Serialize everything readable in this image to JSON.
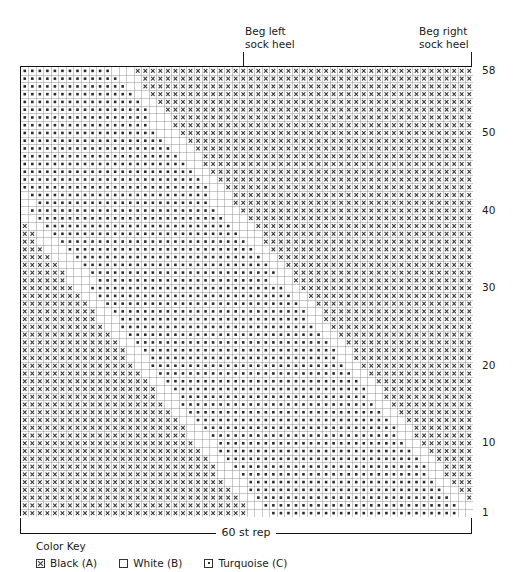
{
  "annotations": {
    "left_heel": "Beg left\nsock heel",
    "right_heel": "Beg right\nsock heel"
  },
  "repeat": {
    "label": "60 st rep"
  },
  "row_numbers": [
    "58",
    "50",
    "40",
    "30",
    "20",
    "10",
    "1"
  ],
  "color_key": {
    "title": "Color Key",
    "items": [
      {
        "symbol": "x",
        "label": "Black (A)",
        "color": "#000000"
      },
      {
        "symbol": "blank",
        "label": "White (B)",
        "color": "#ffffff"
      },
      {
        "symbol": "dot",
        "label": "Turquoise (C)",
        "color": "#30b6c4"
      }
    ]
  },
  "chart_data": {
    "type": "heatmap",
    "title": "60 st rep",
    "xlabel": "60 st rep",
    "ylabel": "Row",
    "columns": 60,
    "rows": 58,
    "row_tick_labels": [
      58,
      50,
      40,
      30,
      20,
      10,
      1
    ],
    "grid": true,
    "legend": [
      "Black (A)",
      "White (B)",
      "Turquoise (C)"
    ],
    "symbol_map": {
      "x": "Black (A)",
      "blank": "White (B)",
      "dot": "Turquoise (C)"
    },
    "annotations": [
      {
        "text": "Beg left sock heel",
        "column": 30,
        "position": "top"
      },
      {
        "text": "Beg right sock heel",
        "column": 60,
        "position": "top"
      }
    ],
    "colors": {
      "black": "#000000",
      "white": "#ffffff",
      "turquoise": "#30b6c4",
      "grid_line": "#6e6e6e",
      "border": "#111111"
    },
    "cells": [
      "dxxxxxxxxxxxxxdxxxxxxxxxxxxxxxxxdxxxxxxxxdxdxxxxxxxxxxxxxxd",
      "xdxxxxxxxxxxxxxxdxxxxxxxxxxxxxxxxdxxxxxxxdxdxxxxxxxxxxxxxxxd",
      "xxdxxxxxxxxxxxxxxxdxxxxxxxxxxxxxxdxxxxxxdxdxxxxxxxxxxxxxxxxd",
      "xxxdxxxxxxxxxxxxxxxdxxxxxxxxxxxxxdxxxxxdxdxxxxxxxxxxxxxxxxxd",
      "xxxxdxxxxxxxxxxxxxxxxdxxxxxxxxxxxdxxxxdxdxxxxxxxxxxxxxxxxxxd",
      "xxxxxdxxxxxxxxxxxxxxxxdxxxxxxxxxxdxxxdxdxxxxxxxxxxxxxxxxxxxd",
      "xxxxxxdxxxxxxxxxxxxxxxxxdxxxxxxxxdxxdxdxxxxxxxxxxxxxxxxxxxxd",
      "xxxxxxxdxxxxxxxxxxxxxxxxxdxxxxxxxdxdxdxxxxxxxxxxxxxxxxxxxxxd",
      "xxxxxxxxdxxxxxxxxxxxxxxxxxxdxxxxxxdxdxxxxxxxxxxxxxxxxxxxxxxd",
      "xxxxxxxxxdxxxxxxxxxxxxxxxxxxdxxxxxdxdxxxxxxxxxxxxxxxxxxxxxxd",
      "xxxxxxxxxxd.............xxxxxxdxxxdxdxxxxxxxxxxxxxxxxxxxxxxd",
      "xxxxxxxxxxxd............xxxxxxxdxdxdxxxxxxxxxxxxxxxxxxxxxxxd",
      "xxxxxxxxxxxxd...........xxxxxxxxdxdxxxxxxxxxxxxxxxxxxxxxxxxd",
      "xxxxxxxxxxxxxd..........xxxxxxxxxdxxxxxxxxxxxxxxxxxxxxxxxxxd",
      "xxxxxxxxxxxxxxd.........xxxxxxxxxxdxxxxxxxxxxxxxxxxxxxxxxxxd",
      "xxxxxxxxxxxxxxxd........xxxxxxxxxxxdxxxxxxxxxxxxxxxxxxxxxxxd",
      "xxxxxxxxxxxxxxxxd.......xxxxxxxxxxxxdxxxxxxxxxxxxxxxxxxxxxxd",
      "xxxxxxxxxxxxxxxxxd......xxxxxxxxxxxxxdxxxxxxxxxxxxxxxxxxxxxd",
      "xxxxxxxxxxxxxxxxxxd.....xxxxxxxxxxxxxxdxxxxxxxxxxxxxxxxxxxxd",
      "xxxxxxxxxxxxxxxxxxxd....xxxxxxxxxxxxxxxdxxxxxxxxxxxxxxxxxxxd",
      "xxxxxxxxxxxxxxxxxxxxd...xxxxxxxxxxxxxxxxdxxxxxxxxxxxxxxxxxxd",
      "xxxxxxxxxxxxxxxxxxxxxd..xxxxxxxxxxxxxxxxxdxxxxxxxxxxxxxxxxxd",
      "xxxxxxxxxxxxxxxxxxxxxxd.xxxxxxxxxxxxxxxxxxdxxxxxxxxxxxxxxxxd",
      "xxxxxxxxxxxxxxxxxxxxxxxdxxxxxxxxxxxxxxxxxxxdxxxxxxxxxxxxxxxd",
      "xxxxxxxxxxxxxxxxxxxxxxxxdxxxxxxxxxxxxxxxxxxxdxxxxxxxxxxxxxxd",
      "xxxxxxxxxxxxxxxxxxxxxxxxxdxxxxxxxxxxxxxxxxxxxdxxxxxxxxxxxxxd",
      "xxxxxxxxxxxxxxxxxxxxxxxxxxdxxxxxxxxxxxxxxxxxxxdxxxxxxxxxxxxd",
      "xxxxxxxxxxxxxxxxxxxxxxxxxxxdxxxxxxxxxxxxxxxxxxxdxxxxxxxxxxxd",
      "xxxxxxxxxxxxxxxxxxxxxxxxxxxxdxxxxxxxxxxxxxxxxxxxdxxxxxxxxxxd",
      "xxxxxxxxxxxxxxxxxxxxxxxxxxxxxdxxxxxxxxxxxxxxxxxxxdxxxxxxxxxd",
      "dxxxxxxxxxxxxxxxxxxxxxxxxxxxxxdxxxxxxxxxxxxxxxxxxxdxxxxxxxxd",
      "xdxxxxxxxxxxxxxxxxxxxxxxxxxxxxxdxxxxxxxxxxxxxxxxxxxdxxxxxxxd",
      "xxdxxxxxxxxxxxxxxxxxxxxxxxxxxxxxdxxxxxxxxxxxxxxxxxxxdxxxxxxd",
      "xxxdxxxxxxxxxxxxxxxxxxxxxxxxxxxxxdxxxxxxxxxxxxxxxxxxxdxxxxxd",
      "xxxxdxxxxxxxxxxxxxxxxxxxxxxxxxxxxxdxxxxxxxxxxxxxxxxxxxdxxxxd",
      "xxxxxdxxxxxxxxxxxxxxxxxxxxxxxxxxxxxdxxxxxxxxxxxxxxxxxxxdxxxd",
      "xxxxxxdxxxxxxxxxxxxxxxxxxxxxxxxxxxxxdxxxxxxxxxxxxxxxxxxxdxxd",
      "xxxxxxxdxxxxxxxxxxxxxxxxxxxxxxxxxxxxxdxxxxxxxxxxxxxxxxxxxdxd",
      "xxxxxxxxdxxxxxxxxxxxxxxxxxxxxxxxxxxxxxdxxxxxxxxxxxxxxxxxxxdd",
      "xxxxxxxxxdxxxxxxxxxxxxxxxxxxxxxxxxxxxxxdxxxxxxxxxxxxxxxxxxxd",
      "xxxxxxxxxxdxxxxxxxxxxxxxxxxxxxxxxxxxxxxxdxxxxxxxxxxxxxxxxxxd",
      "xxxxxxxxxxxdxxxxxxxxxxxxxxxxxxxxxxxxxxxxxdxxxxxxxxxxxxxxxxxd",
      "xxxxxxxxxxxxdxxxxxxxxxxxxxxxxxxxxxxxxxxxxxdxxxxxxxxxxxxxxxxd",
      "xxxxxxxxxxxxxdxxxxxxxxxxxxxxxxxxxxxxxxxxxxxdxxxxxxxxxxxxxxxd",
      "xxxxxxxxxxxxxxdxxxxxxxxxxxxxxxxxxxxxxxxxxxxxdxxxxxxxxxxxxxxd",
      "xxxxxxxxxxxxxxxdxxxxxxxxxxxxxxxxxxxxxxxxxxxxxdxxxxxxxxxxxxxd",
      "xxxxxxxxxxxxxxxxdxxxxxxxxxxxxxxxxxxxxxxxxxxxxxdxxxxxxxxxxxxd",
      "xxxxxxxxxxxxxxxxxdxxxxxxxxxxxxxxxxxxxxxxxxxxxxxdxxxxxxxxxxxd",
      "xxxxxxxxxxxxxxxxxxdxxxxxxxxxxxxxxxxxxxxxxxxxxxxxdxxxxxxxxxxd",
      "xxxxxxxxxxxxxxxxxxxdxxxxxxxxxxxxxxxxxxxxxxxxxxxxxdxxxxxxxxxd",
      "xxxxxxxxxxxxxxxxxxxxdxxxxxxxxxxxxxxxxxxxxxxxxxxxxxdxxxxxxxxd",
      "xxxxxxxxxxxxxxxxxxxxxdxxxxxxxxxxxxxxxxxxxxxxxxxxxxxdxxxxxxxd",
      "xxxxxxxxxxxxxxxxxxxxxxdxxxxxxxxxxxxxxxxxxxxxxxxxxxxxdxxxxxxd",
      "xxxxxxxxxxxxxxxxxxxxxxxdxxxxxxxxxxxxxxxxxxxxxxxxxxxxxdxxxxxd",
      "xxxxxxxxxxxxxxxxxxxxxxxxdxxxxxxxxxxxxxxxxxxxxxxxxxxxxxdxxxxd",
      "xxxxxxxxxxxxxxxxxxxxxxxxxdxxxxxxxxxxxxxxxxxxxxxxxxxxxxxdxxxd",
      "xxxxxxxxxxxxxxxxxxxxxxxxxxdxxxxxxxxxxxxxxxxxxxxxxxxxxxxxdxxd",
      "xxxxxxxxxxxxxxxxxxxxxxxxxxxdxxxxxxxxxxxxxxxxxxxxxxxxxxxxxdxd"
    ]
  }
}
